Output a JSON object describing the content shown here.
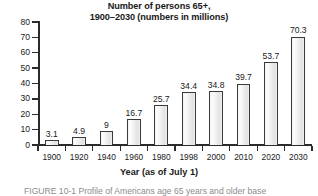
{
  "chart_data": {
    "type": "bar",
    "title": "Number of persons 65+, 1900–2030 (numbers in millions)",
    "title_lines": [
      "Number of persons 65+,",
      "1900–2030 (numbers in millions)"
    ],
    "xlabel": "Year (as of July 1)",
    "ylabel": "",
    "ylim": [
      0,
      80
    ],
    "ytick_step": 10,
    "yticks": [
      "0",
      "10",
      "20",
      "30",
      "40",
      "50",
      "60",
      "70",
      "80"
    ],
    "grid": false,
    "legend": "none",
    "categories": [
      "1900",
      "1920",
      "1940",
      "1960",
      "1980",
      "1998",
      "2000",
      "2010",
      "2020",
      "2030"
    ],
    "values": [
      3.1,
      4.9,
      9,
      16.7,
      25.7,
      34.4,
      34.8,
      39.7,
      53.7,
      70.3
    ],
    "value_labels": [
      "3.1",
      "4.9",
      "9",
      "16.7",
      "25.7",
      "34.4",
      "34.8",
      "39.7",
      "53.7",
      "70.3"
    ],
    "bar_fill_color": "#efefef",
    "bar_edge_color": "#3a3a3a",
    "axis_color": "#2b2b2b"
  },
  "caption": {
    "label": "FIGURE 10-1",
    "text": "FIGURE 10-1   Profile of Americans age 65 years and older base"
  }
}
